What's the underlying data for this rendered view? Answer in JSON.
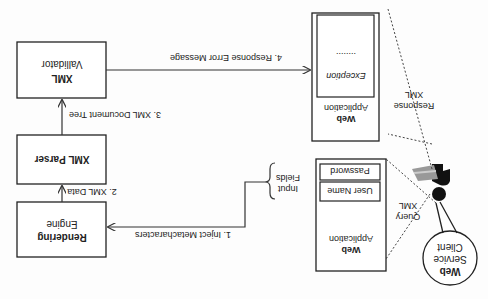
{
  "diagram": {
    "orientation": "rotated-180",
    "nodes": {
      "web_service_client": {
        "line1": "Web",
        "line2": "Service",
        "line3": "Client"
      },
      "web_app_query": {
        "line1": "Web",
        "line2": "Application",
        "field1": "User Name",
        "field2": "Password"
      },
      "web_app_response": {
        "line1": "Web",
        "line2": "Application",
        "exception": "Exception",
        "dots": "........"
      },
      "rendering_engine": {
        "line1": "Rendering",
        "line2": "Engine"
      },
      "xml_parser": {
        "label": "XML Parser"
      },
      "xml_validator": {
        "line1": "XML",
        "line2": "Vallidator"
      }
    },
    "labels": {
      "query_xml_1": "Query",
      "query_xml_2": "XML",
      "response_xml_1": "Response",
      "response_xml_2": "XML",
      "input_fields_1": "Input",
      "input_fields_2": "Fields"
    },
    "edges": {
      "step1": "1. Inject Metacharacters",
      "step2": "2. XML Data",
      "step3": "3. XML Document Tree",
      "step4": "4. Response Error Message"
    }
  }
}
